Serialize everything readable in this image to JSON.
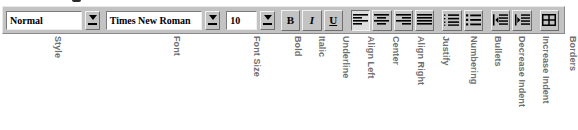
{
  "toolbar": {
    "name": "Formatting toolbar",
    "background_color": "#c3c3c3",
    "controls": {
      "style": {
        "label": "Style",
        "value": "Normal",
        "placeholder": "Style",
        "dropdown_icon": "chevron-down-icon"
      },
      "font": {
        "label": "Font",
        "value": "Times New Roman",
        "placeholder": "Font",
        "dropdown_icon": "chevron-down-icon"
      },
      "font_size": {
        "label": "Font Size",
        "value": "10",
        "placeholder": "Size",
        "dropdown_icon": "chevron-down-icon"
      },
      "bold": {
        "label": "Bold",
        "glyph": "B",
        "icon": "bold-icon",
        "pressed": false
      },
      "italic": {
        "label": "Italic",
        "glyph": "I",
        "icon": "italic-icon",
        "pressed": false
      },
      "underline": {
        "label": "Underline",
        "glyph": "U",
        "icon": "underline-icon",
        "pressed": false
      },
      "align_left": {
        "label": "Align Left",
        "icon": "align-left-icon",
        "pressed": true
      },
      "center": {
        "label": "Center",
        "icon": "align-center-icon",
        "pressed": false
      },
      "align_right": {
        "label": "Align Right",
        "icon": "align-right-icon",
        "pressed": false
      },
      "justify": {
        "label": "Justify",
        "icon": "align-justify-icon",
        "pressed": false
      },
      "numbering": {
        "label": "Numbering",
        "icon": "numbered-list-icon",
        "pressed": false
      },
      "bullets": {
        "label": "Bullets",
        "icon": "bulleted-list-icon",
        "pressed": false
      },
      "decrease_indent": {
        "label": "Decrease Indent",
        "icon": "decrease-indent-icon",
        "pressed": false
      },
      "increase_indent": {
        "label": "Increase Indent",
        "icon": "increase-indent-icon",
        "pressed": false
      },
      "borders": {
        "label": "Borders",
        "icon": "borders-grid-icon",
        "pressed": false
      }
    }
  },
  "captions": {
    "style": "Style",
    "font": "Font",
    "font_size": "Font Size",
    "bold": "Bold",
    "italic": "Italic",
    "underline": "Underline",
    "align_left": "Align Left",
    "center": "Center",
    "align_right": "Align Right",
    "justify": "Justify",
    "numbering": "Numbering",
    "bullets": "Bullets",
    "decrease_indent": "Decrease Indent",
    "increase_indent": "Increase Indent",
    "borders": "Borders"
  },
  "colors": {
    "toolbar_face": "#c3c3c3",
    "field_background": "#ffffff",
    "caption_text": "#6f6f6f",
    "glyph": "#000000",
    "pressed_face": "#dedede"
  }
}
